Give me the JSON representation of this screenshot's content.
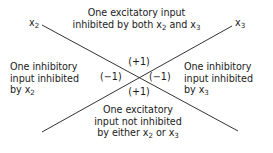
{
  "figure": {
    "title_label": "excitatory-inhibitory-input-quadrant-diagram",
    "line_color": "#333333",
    "text_color": "#1a1a1a",
    "background_color": "#ffffff"
  },
  "axes": {
    "left_label": "x",
    "left_subscript": "2",
    "right_label": "x",
    "right_subscript": "3"
  },
  "quadrants": {
    "top": {
      "line1": "One excitatory input",
      "line2_pre": "inhibited by both x",
      "line2_sub1": "2",
      "line2_mid": " and x",
      "line2_sub2": "3"
    },
    "left": {
      "line1": "One inhibitory",
      "line2": "input inhibited",
      "line3_pre": "by x",
      "line3_sub": "2"
    },
    "right": {
      "line1": "One inhibitory",
      "line2": "input inhibited",
      "line3_pre": "by x",
      "line3_sub": "3"
    },
    "bottom": {
      "line1": "One excitatory",
      "line2": "input not inhibited",
      "line3_pre": "by either x",
      "line3_sub1": "2",
      "line3_mid": " or x",
      "line3_sub2": "3"
    }
  },
  "weights": {
    "top": "(+1)",
    "bottom": "(+1)",
    "left": "(−1)",
    "right": "(−1)"
  },
  "lines": {
    "diagonal_tl_br": {
      "x1": 42,
      "y1": 25,
      "x2": 238,
      "y2": 131
    },
    "diagonal_bl_tr": {
      "x1": 42,
      "y1": 132,
      "x2": 232,
      "y2": 26
    }
  }
}
